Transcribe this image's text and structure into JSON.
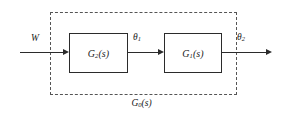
{
  "diagram": {
    "type": "control-system-block-diagram",
    "enclosure": {
      "style": "dashed",
      "caption_prefix": "G",
      "caption_subscript": "0",
      "caption_suffix": "(s)",
      "caption_full": "G0(s)"
    },
    "blocks": [
      {
        "id": "block-g2",
        "prefix": "G",
        "subscript": "2",
        "suffix": "(s)",
        "full": "G2(s)"
      },
      {
        "id": "block-g1",
        "prefix": "G",
        "subscript": "1",
        "suffix": "(s)",
        "full": "G1(s)"
      }
    ],
    "signals": [
      {
        "id": "input",
        "prefix": "W",
        "subscript": "",
        "full": "W"
      },
      {
        "id": "intermediate",
        "prefix": "θ",
        "subscript": "1",
        "full": "θ1"
      },
      {
        "id": "output",
        "prefix": "θ",
        "subscript": "2",
        "full": "θ2"
      }
    ],
    "colors": {
      "line": "#2b2b2b",
      "dashed_border": "#555555",
      "background": "#ffffff",
      "text": "#1a1a1a"
    }
  }
}
